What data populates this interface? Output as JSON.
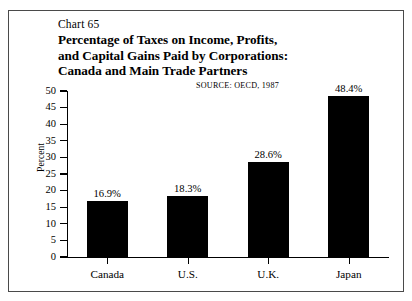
{
  "chart_data": {
    "type": "bar",
    "number_label": "Chart 65",
    "title_lines": [
      "Percentage of Taxes on Income, Profits,",
      "and Capital Gains Paid by Corporations:",
      "Canada and Main Trade Partners"
    ],
    "title": "Percentage of Taxes on Income, Profits, and Capital Gains Paid by Corporations: Canada and Main Trade Partners",
    "source": "SOURCE:  OECD, 1987",
    "categories": [
      "Canada",
      "U.S.",
      "U.K.",
      "Japan"
    ],
    "values": [
      16.9,
      18.3,
      28.6,
      48.4
    ],
    "value_labels": [
      "16.9%",
      "18.3%",
      "28.6%",
      "48.4%"
    ],
    "xlabel": "",
    "ylabel": "Percent",
    "ylim": [
      0,
      50
    ],
    "ytick_values": [
      0,
      5,
      10,
      15,
      20,
      25,
      30,
      35,
      40,
      45,
      50
    ],
    "ytick_labels": [
      "0",
      "5",
      "10",
      "15",
      "20",
      "25",
      "30",
      "35",
      "40",
      "45",
      "50"
    ],
    "grid": false,
    "legend": false,
    "bar_color": "#000000",
    "frame_color": "#4a4a4a",
    "background_color": "#ffffff"
  }
}
